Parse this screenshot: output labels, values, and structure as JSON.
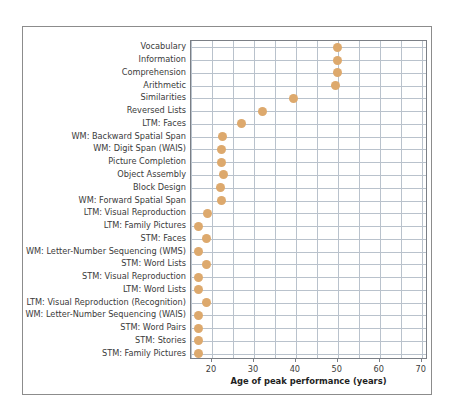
{
  "chart": {
    "xlabel": "Age of peak performance (years)",
    "ylabel": "",
    "title": "",
    "marker_color": "#dda96d",
    "grid_color": "#b9c2cc",
    "axis_color": "#7b7f86"
  },
  "chart_data": {
    "type": "scatter",
    "title": "",
    "xlabel": "Age of peak performance (years)",
    "ylabel": "",
    "xlim": [
      15,
      71.5
    ],
    "xticks": [
      20,
      30,
      40,
      50,
      60,
      70
    ],
    "xtick_labels": [
      "20",
      "30",
      "40",
      "50",
      "60",
      "70"
    ],
    "grid": true,
    "gridline_step": 5,
    "legend": "none",
    "orientation": "horizontal",
    "categories": [
      "Vocabulary",
      "Information",
      "Comprehension",
      "Arithmetic",
      "Similarities",
      "Reversed Lists",
      "LTM: Faces",
      "WM: Backward Spatial Span",
      "WM: Digit Span (WAIS)",
      "Picture Completion",
      "Object Assembly",
      "Block Design",
      "WM: Forward Spatial Span",
      "LTM: Visual Reproduction",
      "LTM: Family Pictures",
      "STM: Faces",
      "WM: Letter-Number Sequencing (WMS)",
      "STM: Word Lists",
      "STM: Visual Reproduction",
      "LTM: Word Lists",
      "LTM: Visual Reproduction (Recognition)",
      "WM: Letter-Number Sequencing (WAIS)",
      "STM: Word Pairs",
      "STM: Stories",
      "STM: Family Pictures"
    ],
    "values": [
      50,
      50,
      50,
      49.5,
      39.5,
      32,
      27,
      22.5,
      22.3,
      22.2,
      22.7,
      22,
      22.2,
      19,
      16.8,
      18.8,
      16.8,
      18.8,
      16.8,
      16.8,
      18.8,
      16.8,
      16.8,
      16.8,
      16.8
    ]
  }
}
